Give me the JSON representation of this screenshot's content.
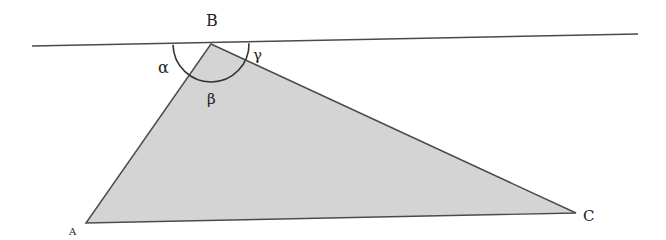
{
  "diagram": {
    "vertices": {
      "A": {
        "label": "A",
        "x": 86,
        "y": 223
      },
      "B": {
        "label": "B",
        "x": 211,
        "y": 44
      },
      "C": {
        "label": "C",
        "x": 576,
        "y": 213
      }
    },
    "parallel_line": {
      "x1": 32,
      "y1": 46,
      "x2": 638,
      "y2": 34
    },
    "arc": {
      "cx": 211,
      "cy": 44,
      "r": 38
    },
    "angle_labels": {
      "alpha": {
        "label": "α",
        "x": 166,
        "y": 73
      },
      "beta": {
        "label": "β",
        "x": 213,
        "y": 104
      },
      "gamma": {
        "label": "γ",
        "x": 258,
        "y": 60
      }
    },
    "colors": {
      "fill": "#d4d4d4",
      "stroke": "#4a4a4a",
      "text": "#222222"
    }
  }
}
